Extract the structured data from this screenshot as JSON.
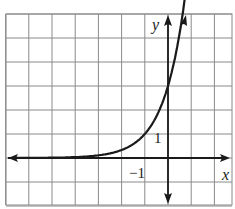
{
  "chart_data": {
    "type": "line",
    "title": "",
    "xlabel": "x",
    "ylabel": "y",
    "xlim": [
      -7,
      2.8
    ],
    "ylim": [
      -2,
      6
    ],
    "grid": true,
    "grid_step": 1,
    "tick_labels": {
      "x": [
        "-1"
      ],
      "y": [
        "1"
      ]
    },
    "series": [
      {
        "name": "exponential curve",
        "function": "y = 3^(x+1)",
        "x": [
          -7,
          -6,
          -5,
          -4,
          -3,
          -2,
          -1,
          -0.5,
          0,
          0.5,
          0.85
        ],
        "values": [
          0.0014,
          0.0041,
          0.0123,
          0.037,
          0.111,
          0.333,
          1,
          1.732,
          3,
          5.196,
          7.6
        ]
      }
    ],
    "annotations": [
      "left arrow on curve asymptote",
      "arrow at top of curve"
    ]
  },
  "labels": {
    "x_axis": "x",
    "y_axis": "y",
    "x_tick": "−1",
    "y_tick": "1"
  },
  "colors": {
    "grid": "#8a8a8a",
    "axis": "#1a1a1a",
    "curve": "#1a1a1a",
    "background": "#ffffff"
  }
}
